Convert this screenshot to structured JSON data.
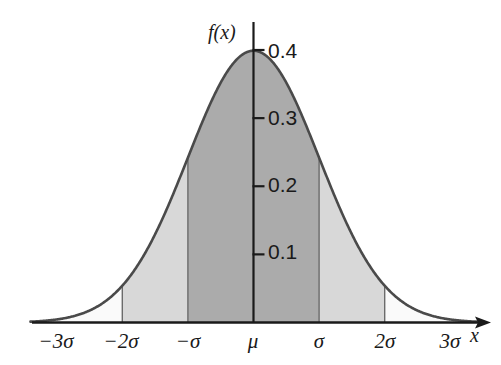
{
  "figure": {
    "background_color": "#ffffff",
    "curve_color": "#4a4a4a",
    "axis_color": "#1a1a1a",
    "fill_inner_color": "#ababab",
    "fill_outer_color": "#d8d8d8",
    "fill_tail_color": "#fafafa"
  },
  "axes": {
    "y_axis_label": "f(x)",
    "x_axis_label": "x",
    "y_ticks": [
      {
        "value": 0.1,
        "label": "0.1"
      },
      {
        "value": 0.2,
        "label": "0.2"
      },
      {
        "value": 0.3,
        "label": "0.3"
      },
      {
        "value": 0.4,
        "label": "0.4"
      }
    ],
    "x_ticks": [
      {
        "value": -3,
        "label": "−3σ"
      },
      {
        "value": -2,
        "label": "−2σ"
      },
      {
        "value": -1,
        "label": "−σ"
      },
      {
        "value": 0,
        "label": "μ"
      },
      {
        "value": 1,
        "label": "σ"
      },
      {
        "value": 2,
        "label": "2σ"
      },
      {
        "value": 3,
        "label": "3σ"
      }
    ]
  },
  "chart_data": {
    "type": "line",
    "title": "",
    "xlabel": "x",
    "ylabel": "f(x)",
    "xlim": [
      -3.4,
      3.4
    ],
    "ylim": [
      0,
      0.42
    ],
    "grid": false,
    "legend": "none",
    "distribution": {
      "name": "normal",
      "mean_label": "μ",
      "std_label": "σ",
      "peak_density": 0.4
    },
    "x": [
      -3.4,
      -3.2,
      -3.0,
      -2.8,
      -2.6,
      -2.4,
      -2.2,
      -2.0,
      -1.8,
      -1.6,
      -1.4,
      -1.2,
      -1.0,
      -0.8,
      -0.6,
      -0.4,
      -0.2,
      0.0,
      0.2,
      0.4,
      0.6,
      0.8,
      1.0,
      1.2,
      1.4,
      1.6,
      1.8,
      2.0,
      2.2,
      2.4,
      2.6,
      2.8,
      3.0,
      3.2,
      3.4
    ],
    "y": [
      0.0012,
      0.0024,
      0.0044,
      0.0079,
      0.0136,
      0.0224,
      0.0355,
      0.054,
      0.079,
      0.1109,
      0.1497,
      0.1942,
      0.242,
      0.2897,
      0.3332,
      0.3683,
      0.391,
      0.3989,
      0.391,
      0.3683,
      0.3332,
      0.2897,
      0.242,
      0.1942,
      0.1497,
      0.1109,
      0.079,
      0.054,
      0.0355,
      0.0224,
      0.0136,
      0.0079,
      0.0044,
      0.0024,
      0.0012
    ],
    "shaded_regions": [
      {
        "name": "one-sigma-band",
        "from": -1,
        "to": 1,
        "color": "#ababab"
      },
      {
        "name": "two-sigma-band-left",
        "from": -2,
        "to": -1,
        "color": "#d8d8d8"
      },
      {
        "name": "two-sigma-band-right",
        "from": 1,
        "to": 2,
        "color": "#d8d8d8"
      }
    ],
    "boundary_lines": [
      -2,
      -1,
      1,
      2
    ]
  }
}
